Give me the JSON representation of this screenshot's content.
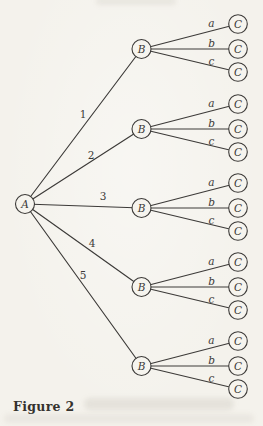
{
  "page": {
    "paper_color": "#f4f2ec",
    "ink_color": "#3c3a38",
    "node_fill": "#f6f4ee",
    "caption_color": "#35322e"
  },
  "figure": {
    "caption": "Figure 2",
    "tree": {
      "root_label": "A",
      "branches": [
        {
          "edge_label": "1",
          "node_label": "B",
          "children": [
            {
              "edge_label": "a",
              "node_label": "C"
            },
            {
              "edge_label": "b",
              "node_label": "C"
            },
            {
              "edge_label": "c",
              "node_label": "C"
            }
          ]
        },
        {
          "edge_label": "2",
          "node_label": "B",
          "children": [
            {
              "edge_label": "a",
              "node_label": "C"
            },
            {
              "edge_label": "b",
              "node_label": "C"
            },
            {
              "edge_label": "c",
              "node_label": "C"
            }
          ]
        },
        {
          "edge_label": "3",
          "node_label": "B",
          "children": [
            {
              "edge_label": "a",
              "node_label": "C"
            },
            {
              "edge_label": "b",
              "node_label": "C"
            },
            {
              "edge_label": "c",
              "node_label": "C"
            }
          ]
        },
        {
          "edge_label": "4",
          "node_label": "B",
          "children": [
            {
              "edge_label": "a",
              "node_label": "C"
            },
            {
              "edge_label": "b",
              "node_label": "C"
            },
            {
              "edge_label": "c",
              "node_label": "C"
            }
          ]
        },
        {
          "edge_label": "5",
          "node_label": "B",
          "children": [
            {
              "edge_label": "a",
              "node_label": "C"
            },
            {
              "edge_label": "b",
              "node_label": "C"
            },
            {
              "edge_label": "c",
              "node_label": "C"
            }
          ]
        }
      ]
    }
  }
}
